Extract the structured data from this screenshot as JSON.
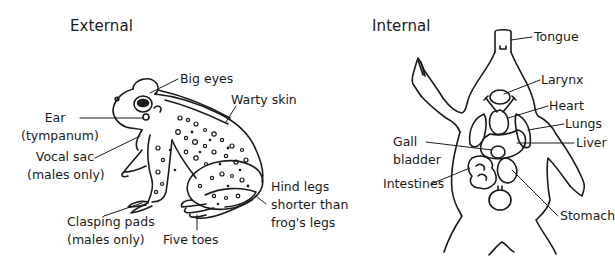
{
  "panels": {
    "external": {
      "title": "External",
      "labels": {
        "big_eyes": [
          "Big eyes"
        ],
        "warty_skin": [
          "Warty skin"
        ],
        "ear": [
          "Ear",
          "(tympanum)"
        ],
        "vocal_sac": [
          "Vocal sac",
          "(males only)"
        ],
        "clasping_pads": [
          "Clasping pads",
          "(males only)"
        ],
        "five_toes": [
          "Five toes"
        ],
        "hind_legs": [
          "Hind legs",
          "shorter than",
          "frog's legs"
        ]
      }
    },
    "internal": {
      "title": "Internal",
      "labels": {
        "tongue": [
          "Tongue"
        ],
        "larynx": [
          "Larynx"
        ],
        "heart": [
          "Heart"
        ],
        "lungs": [
          "Lungs"
        ],
        "liver": [
          "Liver"
        ],
        "gall_bladder": [
          "Gall",
          "bladder"
        ],
        "intestines": [
          "Intestines"
        ],
        "stomach": [
          "Stomach"
        ]
      }
    }
  },
  "colors": {
    "ink": "#1a1a1a",
    "background": "#ffffff"
  }
}
